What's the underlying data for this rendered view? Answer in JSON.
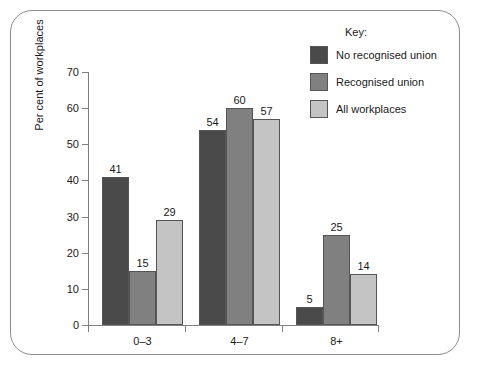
{
  "figure": {
    "frame_color": "#8c8c8c",
    "background": "#ffffff"
  },
  "legend": {
    "title": "Key:",
    "entries": [
      {
        "label": "No recognised union",
        "color": "#4a4a4a"
      },
      {
        "label": "Recognised union",
        "color": "#808080"
      },
      {
        "label": "All workplaces",
        "color": "#c4c4c4"
      }
    ]
  },
  "chart_data": {
    "type": "bar",
    "title": "",
    "xlabel": "",
    "ylabel": "Per cent of workplaces",
    "categories": [
      "0–3",
      "4–7",
      "8+"
    ],
    "series": [
      {
        "name": "No recognised union",
        "color": "#4a4a4a",
        "values": [
          41,
          54,
          5
        ]
      },
      {
        "name": "Recognised union",
        "color": "#808080",
        "values": [
          15,
          60,
          25
        ]
      },
      {
        "name": "All workplaces",
        "color": "#c4c4c4",
        "values": [
          29,
          57,
          14
        ]
      }
    ],
    "ylim": [
      0,
      70
    ],
    "yticks": [
      0,
      10,
      20,
      30,
      40,
      50,
      60,
      70
    ],
    "ytick_labels": [
      "0",
      "10",
      "20",
      "30",
      "40",
      "50",
      "60",
      "70"
    ],
    "grid": false,
    "legend_position": "top-right",
    "data_labels": true
  },
  "axis": {
    "y_label": "Per cent of workplaces",
    "y_ticks": [
      "0",
      "10",
      "20",
      "30",
      "40",
      "50",
      "60",
      "70"
    ],
    "x_ticks": [
      "0–3",
      "4–7",
      "8+"
    ]
  }
}
